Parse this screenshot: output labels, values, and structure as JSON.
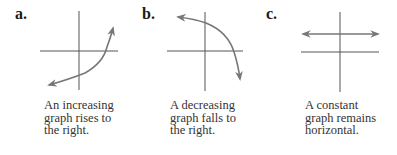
{
  "panels": [
    {
      "label": "a.",
      "caption_lines": [
        "An increasing",
        "graph rises to",
        "the right."
      ],
      "curve": "increasing"
    },
    {
      "label": "b.",
      "caption_lines": [
        "A decreasing",
        "graph falls to",
        "the right."
      ],
      "curve": "decreasing"
    },
    {
      "label": "c.",
      "caption_lines": [
        "A constant",
        "graph remains",
        "horizontal."
      ],
      "curve": "constant"
    }
  ],
  "colors": {
    "axis": "#555555",
    "curve": "#777777",
    "text": "#333333"
  }
}
